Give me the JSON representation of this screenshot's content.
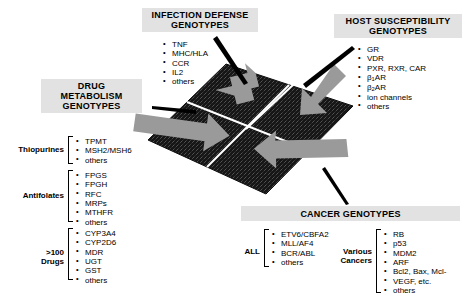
{
  "diagram": {
    "colors": {
      "box_fill": "#e2e2e2",
      "grid_dark": "#171717",
      "arrow_gray": "#9a9a9a",
      "grid_line": "#ffffff",
      "text": "#000000"
    }
  },
  "panels": {
    "infection_defense": {
      "title": "INFECTION DEFENSE\nGENOTYPES",
      "title_line1": "INFECTION DEFENSE",
      "title_line2": "GENOTYPES",
      "items": [
        "TNF",
        "MHC/HLA",
        "CCR",
        "IL2",
        "others"
      ]
    },
    "host_susceptibility": {
      "title_line1": "HOST SUSCEPTIBILITY",
      "title_line2": "GENOTYPES",
      "items": [
        {
          "text": "GR"
        },
        {
          "text": "VDR"
        },
        {
          "text": "PXR, RXR, CAR"
        },
        {
          "pre": "β",
          "sub": "1",
          "post": "AR"
        },
        {
          "pre": "β",
          "sub": "2",
          "post": "AR"
        },
        {
          "text": "ion channels"
        },
        {
          "text": "others"
        }
      ]
    },
    "drug_metabolism": {
      "title_line1": "DRUG",
      "title_line2": "METABOLISM",
      "title_line3": "GENOTYPES",
      "groups": [
        {
          "label": "Thiopurines",
          "items": [
            "TPMT",
            "MSH2/MSH6",
            "others"
          ]
        },
        {
          "label": "Antifolates",
          "items": [
            "FPGS",
            "FPGH",
            "RFC",
            "MRPs",
            "MTHFR",
            "others"
          ]
        },
        {
          "label_line1": ">100",
          "label_line2": "Drugs",
          "items": [
            "CYP3A4",
            "CYP2D6",
            "MDR",
            "UGT",
            "GST",
            "others"
          ]
        }
      ]
    },
    "cancer_genotypes": {
      "title": "CANCER GENOTYPES",
      "groups": [
        {
          "label": "ALL",
          "items": [
            "ETV6/CBFA2",
            "MLL/AF4",
            "BCR/ABL",
            "others"
          ]
        },
        {
          "label_line1": "Various",
          "label_line2": "Cancers",
          "items": [
            "RB",
            "p53",
            "MDM2",
            "ARF",
            "Bcl2, Bax, Mcl-",
            "VEGF, etc.",
            "others"
          ]
        }
      ]
    }
  }
}
